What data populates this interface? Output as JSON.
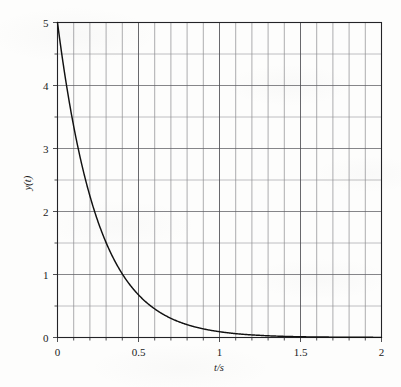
{
  "figure": {
    "name": "exponential-decay-plot",
    "background_color": "#fdfdfc",
    "ink_color": "#1a1a1a",
    "grid_color": "#6e6e72"
  },
  "chart_data": {
    "type": "line",
    "title": "",
    "subtitle": "",
    "xlabel": "t/s",
    "ylabel": "y(t)",
    "xlim": [
      0,
      2
    ],
    "ylim": [
      0,
      5
    ],
    "grid": true,
    "legend": "none",
    "x_major_ticks": [
      0,
      0.5,
      1,
      1.5,
      2
    ],
    "x_major_tick_labels": [
      "0",
      "0.5",
      "1",
      "1.5",
      "2"
    ],
    "x_minor_step": 0.1,
    "y_major_ticks": [
      0,
      1,
      2,
      3,
      4,
      5
    ],
    "y_major_tick_labels": [
      "0",
      "1",
      "2",
      "3",
      "4",
      "5"
    ],
    "y_minor_step": 0.5,
    "series": [
      {
        "name": "y(t)",
        "expression": "5*exp(-4*t)",
        "color": "#111111",
        "line_width": 1.4,
        "x": [
          0,
          0.05,
          0.1,
          0.15,
          0.2,
          0.25,
          0.3,
          0.35,
          0.4,
          0.45,
          0.5,
          0.55,
          0.6,
          0.65,
          0.7,
          0.75,
          0.8,
          0.85,
          0.9,
          0.95,
          1.0,
          1.05,
          1.1,
          1.15,
          1.2,
          1.25,
          1.3,
          1.4,
          1.5,
          1.6,
          1.7,
          1.8,
          1.9,
          2.0
        ],
        "values": [
          5.0,
          4.094,
          3.352,
          2.744,
          2.247,
          1.839,
          1.506,
          1.233,
          1.009,
          0.826,
          0.677,
          0.554,
          0.454,
          0.371,
          0.304,
          0.249,
          0.204,
          0.167,
          0.137,
          0.112,
          0.092,
          0.075,
          0.061,
          0.05,
          0.041,
          0.034,
          0.027,
          0.018,
          0.012,
          0.008,
          0.006,
          0.004,
          0.003,
          0.002
        ]
      }
    ],
    "annotations": []
  }
}
